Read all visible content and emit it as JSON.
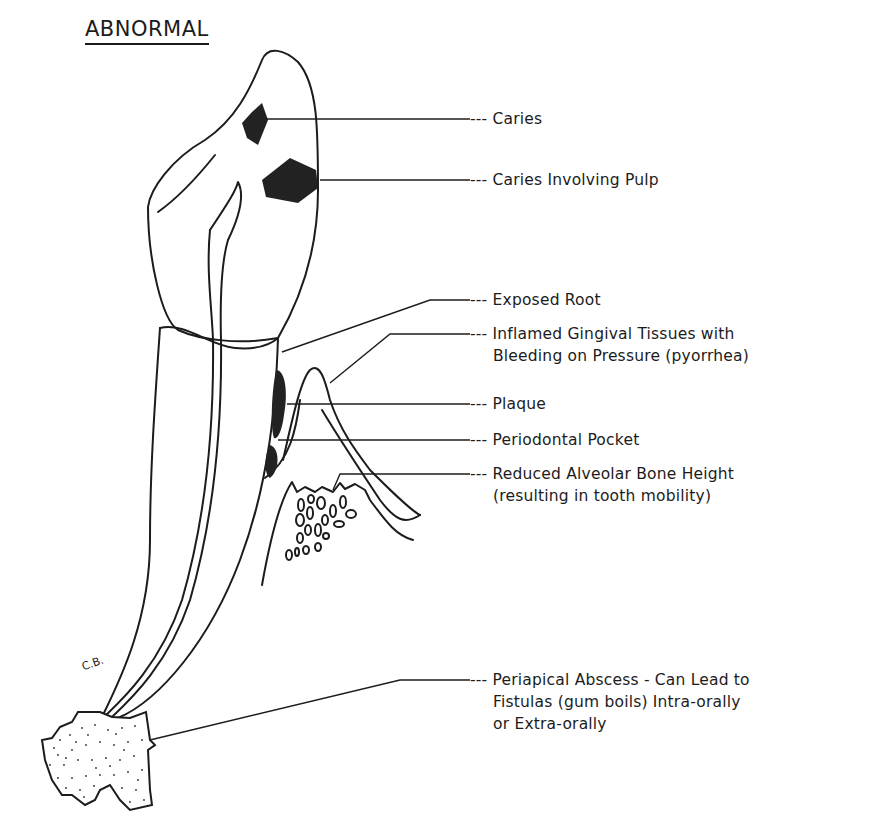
{
  "title": "ABNORMAL",
  "labels": [
    {
      "id": "caries",
      "lines": [
        "Caries"
      ]
    },
    {
      "id": "caries-pulp",
      "lines": [
        "Caries Involving Pulp"
      ]
    },
    {
      "id": "exposed-root",
      "lines": [
        "Exposed Root"
      ]
    },
    {
      "id": "inflamed-gingiva",
      "lines": [
        "Inflamed Gingival Tissues with",
        "Bleeding on Pressure (pyorrhea)"
      ]
    },
    {
      "id": "plaque",
      "lines": [
        "Plaque"
      ]
    },
    {
      "id": "periodontal-pocket",
      "lines": [
        "Periodontal Pocket"
      ]
    },
    {
      "id": "reduced-bone",
      "lines": [
        "Reduced Alveolar Bone Height",
        "(resulting in tooth mobility)"
      ]
    },
    {
      "id": "periapical-abscess",
      "lines": [
        "Periapical Abscess - Can Lead to",
        "Fistulas (gum boils) Intra-orally",
        "or Extra-orally"
      ]
    }
  ],
  "leader_prefix": "---",
  "signature": "C.B.",
  "colors": {
    "ink": "#1c1c1c",
    "lesion": "#222222",
    "background": "#ffffff"
  }
}
